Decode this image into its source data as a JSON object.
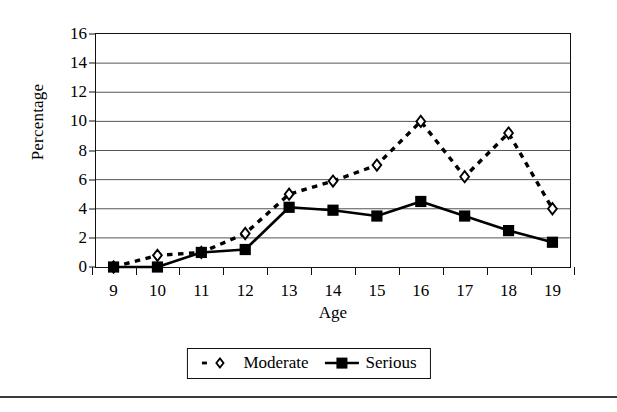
{
  "chart_data": {
    "type": "line",
    "title": "",
    "xlabel": "Age",
    "ylabel": "Percentage",
    "x": [
      9,
      10,
      11,
      12,
      13,
      14,
      15,
      16,
      17,
      18,
      19
    ],
    "xticklabels": [
      "9",
      "10",
      "11",
      "12",
      "13",
      "14",
      "15",
      "16",
      "17",
      "18",
      "19"
    ],
    "yticks": [
      0,
      2,
      4,
      6,
      8,
      10,
      12,
      14,
      16
    ],
    "yticklabels": [
      "0",
      "2",
      "4",
      "6",
      "8",
      "10",
      "12",
      "14",
      "16"
    ],
    "xlim": [
      8.6,
      19.4
    ],
    "ylim": [
      0,
      16
    ],
    "grid": "horizontal",
    "legend_position": "bottom-center",
    "series": [
      {
        "name": "Moderate",
        "linestyle": "dotted",
        "marker": "open-diamond",
        "color": "#000000",
        "values": [
          0.0,
          0.8,
          1.0,
          2.3,
          5.0,
          5.9,
          7.0,
          10.0,
          6.2,
          9.2,
          4.0
        ]
      },
      {
        "name": "Serious",
        "linestyle": "solid",
        "marker": "filled-square",
        "color": "#000000",
        "values": [
          0.0,
          0.0,
          1.0,
          1.2,
          4.1,
          3.9,
          3.5,
          4.5,
          3.5,
          2.5,
          1.7
        ]
      }
    ]
  },
  "legend": {
    "items": [
      {
        "label": "Moderate"
      },
      {
        "label": "Serious"
      }
    ]
  }
}
